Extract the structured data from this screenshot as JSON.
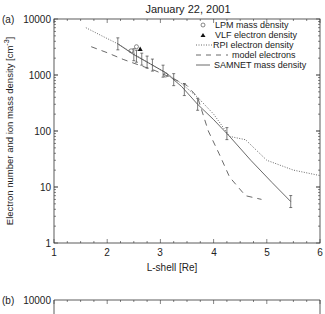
{
  "chart_data": [
    {
      "panel": "(a)",
      "type": "line",
      "title": "January 22, 2001",
      "xlabel": "L-shell [Re]",
      "ylabel": "Electron number and ion mass density [cm⁻³]",
      "xlim": [
        1,
        6
      ],
      "ylim": [
        1,
        10000
      ],
      "yscale": "log",
      "x_ticks": [
        "1",
        "2",
        "3",
        "4",
        "5",
        "6"
      ],
      "y_ticks": [
        "1",
        "10",
        "100",
        "1000",
        "10000"
      ],
      "legend_position": "upper right",
      "legend": [
        "LPM mass density",
        "VLF electron density",
        "RPI electron density",
        "model electrons",
        "SAMNET mass density"
      ],
      "series": [
        {
          "name": "RPI electron density",
          "style": "dotted",
          "x": [
            1.6,
            1.9,
            2.2,
            2.5,
            2.8,
            3.1,
            3.4,
            3.7,
            4.0,
            4.3,
            4.6,
            5.0,
            5.5,
            6.0
          ],
          "y": [
            7000,
            5000,
            3600,
            2400,
            1600,
            1100,
            700,
            400,
            200,
            80,
            70,
            30,
            20,
            16
          ]
        },
        {
          "name": "model electrons",
          "style": "dashed",
          "x": [
            1.7,
            2.0,
            2.3,
            2.6,
            2.9,
            3.2,
            3.5,
            3.7,
            3.9,
            4.1,
            4.3,
            4.6,
            4.9
          ],
          "y": [
            3200,
            2500,
            1900,
            1500,
            1200,
            900,
            650,
            400,
            100,
            40,
            15,
            7,
            6
          ]
        },
        {
          "name": "SAMNET mass density",
          "style": "solid",
          "x": [
            2.2,
            2.5,
            2.8,
            3.1,
            3.4,
            3.7,
            4.0,
            4.3,
            4.7,
            5.1,
            5.45
          ],
          "y": [
            3600,
            2300,
            1600,
            1100,
            620,
            300,
            160,
            80,
            30,
            12,
            5.5
          ],
          "error_bars_at": [
            2.2,
            2.5,
            2.55,
            2.65,
            2.75,
            2.85,
            3.05,
            3.25,
            3.45,
            3.7,
            4.25,
            5.45
          ]
        },
        {
          "name": "LPM mass density",
          "style": "open-circle",
          "x": [
            2.45,
            2.55,
            3.1
          ],
          "y": [
            2700,
            3200,
            1000
          ]
        },
        {
          "name": "VLF electron density",
          "style": "filled-triangle",
          "x": [
            2.62
          ],
          "y": [
            2900
          ]
        }
      ]
    },
    {
      "panel": "(b)",
      "type": "line",
      "y_ticks": [
        "10000"
      ],
      "note": "panel truncated at bottom of screenshot"
    }
  ],
  "labels": {
    "title": "January 22, 2001",
    "panel_a": "(a)",
    "panel_b": "(b)",
    "xlabel": "L-shell [Re]",
    "ylabel": "Electron number and ion mass density [cm",
    "ylabel_sup": "-3",
    "ylabel_end": "]",
    "yt_10000": "10000",
    "yt_1000": "1000",
    "yt_100": "100",
    "yt_10": "10",
    "yt_1": "1",
    "xt_1": "1",
    "xt_2": "2",
    "xt_3": "3",
    "xt_4": "4",
    "xt_5": "5",
    "xt_6": "6",
    "b_yt_10000": "10000",
    "legend_lpm": "LPM mass density",
    "legend_vlf": "VLF electron density",
    "legend_rpi": "RPI electron density",
    "legend_model": "model electrons",
    "legend_samnet": "SAMNET mass density"
  }
}
